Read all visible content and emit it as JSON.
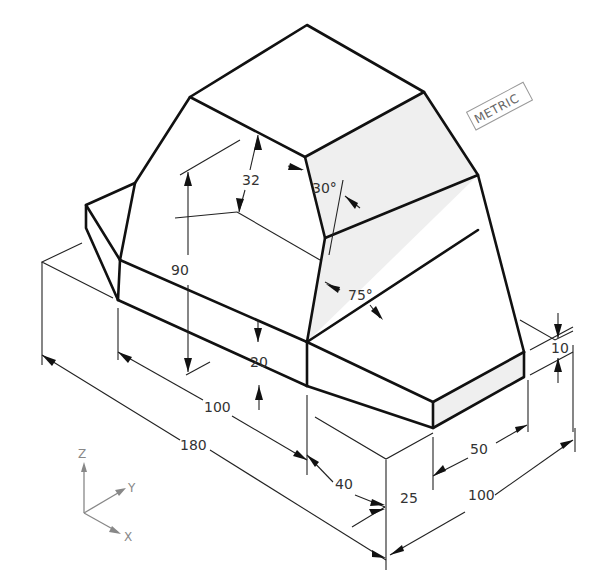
{
  "figure": {
    "type": "isometric technical drawing",
    "units_badge": "METRIC",
    "dimensions": {
      "overall_length": "180",
      "body_length": "100",
      "total_height": "90",
      "chamfer_height": "32",
      "base_step_height": "20",
      "front_offset": "40",
      "base_thickness": "25",
      "width": "100",
      "right_step": "50",
      "right_ledge": "10"
    },
    "angles": {
      "upper_slope": "30°",
      "lower_slope": "75°"
    },
    "axes": {
      "z": "Z",
      "y": "Y",
      "x": "X"
    }
  }
}
